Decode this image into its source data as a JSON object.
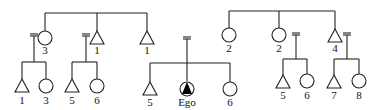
{
  "diagram": {
    "type": "kinship-chart",
    "line_color": "#222222",
    "ego_fill": "#000000",
    "groups": [
      {
        "id": "left-sibling-set",
        "members": [
          {
            "sex": "female",
            "label": "3",
            "married": true,
            "children": [
              {
                "sex": "male",
                "label": "1"
              },
              {
                "sex": "female",
                "label": "3"
              }
            ]
          },
          {
            "sex": "male",
            "label": "1",
            "married": true,
            "children": [
              {
                "sex": "male",
                "label": "5"
              },
              {
                "sex": "female",
                "label": "6"
              }
            ]
          },
          {
            "sex": "male",
            "label": "1",
            "married": false
          }
        ]
      },
      {
        "id": "ego-sibling-set",
        "members": [
          {
            "sex": "male",
            "label": "5"
          },
          {
            "sex": "ego",
            "label": "Ego"
          },
          {
            "sex": "female",
            "label": "6"
          }
        ]
      },
      {
        "id": "right-sibling-set",
        "members": [
          {
            "sex": "female",
            "label": "2",
            "married": false
          },
          {
            "sex": "female",
            "label": "2",
            "married": true,
            "children": [
              {
                "sex": "male",
                "label": "5"
              },
              {
                "sex": "female",
                "label": "6"
              }
            ]
          },
          {
            "sex": "male",
            "label": "4",
            "married": true,
            "children": [
              {
                "sex": "male",
                "label": "7"
              },
              {
                "sex": "female",
                "label": "8"
              }
            ]
          }
        ]
      }
    ],
    "labels": {
      "l_f3": "3",
      "l_m1a": "1",
      "l_m1b": "1",
      "l_c1": "1",
      "l_c3": "3",
      "l_c5": "5",
      "l_c6": "6",
      "e_m5": "5",
      "e_ego": "Ego",
      "e_f6": "6",
      "r_f2a": "2",
      "r_f2b": "2",
      "r_m4": "4",
      "r_c5": "5",
      "r_c6": "6",
      "r_c7": "7",
      "r_c8": "8"
    }
  }
}
